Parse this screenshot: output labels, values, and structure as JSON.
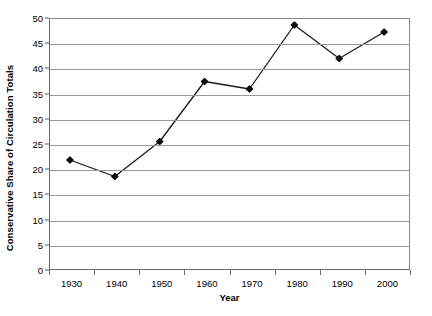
{
  "chart_data": {
    "type": "line",
    "title": "",
    "xlabel": "Year",
    "ylabel": "Conservative Share of Circulation Totals",
    "categories": [
      "1930",
      "1940",
      "1950",
      "1960",
      "1970",
      "1980",
      "1990",
      "2000"
    ],
    "values": [
      21.8,
      18.5,
      25.5,
      37.5,
      36.0,
      48.8,
      42.1,
      47.4
    ],
    "series": [
      {
        "name": "Conservative Share of Circulation Totals",
        "values": [
          21.8,
          18.5,
          25.5,
          37.5,
          36.0,
          48.8,
          42.1,
          47.4
        ]
      }
    ],
    "ylim": [
      0,
      50
    ],
    "y_ticks": [
      0,
      5,
      10,
      15,
      20,
      25,
      30,
      35,
      40,
      45,
      50
    ],
    "y_tick_labels": [
      "0",
      "5",
      "10",
      "15",
      "20",
      "25",
      "30",
      "35",
      "40",
      "45",
      "50"
    ],
    "x_tick_labels": [
      "1930",
      "1940",
      "1950",
      "1960",
      "1970",
      "1980",
      "1990",
      "2000"
    ],
    "grid": true,
    "grid_axis": "y",
    "legend": false,
    "legend_position": "none",
    "marker": "diamond",
    "line_color": "#1a1a1a",
    "marker_color": "#0d0d0d",
    "grid_color": "#9a9a9a",
    "axis_color": "#6b6b6b",
    "background_color": "#ffffff"
  }
}
